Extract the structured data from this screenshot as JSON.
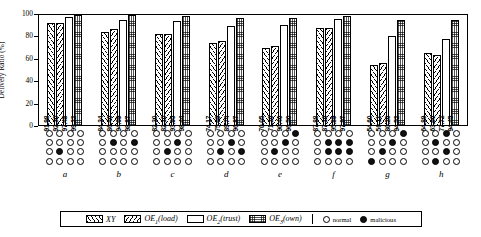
{
  "chart_data": {
    "type": "bar",
    "title": "",
    "xlabel": "",
    "ylabel": "Delivery Ratio (%)",
    "ylim": [
      0,
      100
    ],
    "yticks": [
      "0",
      "20",
      "40",
      "60",
      "80",
      "100"
    ],
    "grid": false,
    "legend_position": "bottom",
    "categories": [
      "a",
      "b",
      "c",
      "d",
      "e",
      "f",
      "g",
      "h"
    ],
    "series": [
      {
        "name": "XY",
        "pattern": "diagonal-hatch",
        "values": [
          91.98,
          84.34,
          82.3,
          74.17,
          70.05,
          87.88,
          54.6,
          64.89
        ],
        "labels": [
          "91.98",
          "84.34",
          "82.30",
          "74.17",
          "70.05",
          "87.88",
          "54.60",
          "64.89"
        ]
      },
      {
        "name": "OE1(load)",
        "pattern": "angled-hatch",
        "values": [
          92.3,
          86.46,
          82.1,
          75.69,
          71.26,
          87.16,
          56.11,
          63.66
        ],
        "labels": [
          "92.30",
          "86.46",
          "82.10",
          "75.69",
          "71.26",
          "87.16",
          "56.11",
          "63.66"
        ]
      },
      {
        "name": "OE2(trust)",
        "pattern": "plain-white",
        "values": [
          97.48,
          94.69,
          93.95,
          89.74,
          90.46,
          95.89,
          80.26,
          77.72
        ],
        "labels": [
          "97.48",
          "94.69",
          "93.95",
          "89.74",
          "90.46",
          "95.89",
          "80.26",
          "77.72"
        ]
      },
      {
        "name": "OE3(own)",
        "pattern": "grid-mesh",
        "values": [
          99.22,
          98.87,
          98.44,
          96.87,
          96.5,
          97.97,
          94.52,
          94.45
        ],
        "labels": [
          "99.22",
          "98.87",
          "98.44",
          "96.87",
          "96.50",
          "97.97",
          "94.52",
          "94.45"
        ]
      }
    ],
    "node_matrix": {
      "rows": 4,
      "cols": 4,
      "legend": {
        "normal": "normal",
        "malicious": "malicious"
      },
      "groups": [
        {
          "label": "a",
          "cells": [
            [
              0,
              0,
              0,
              0
            ],
            [
              0,
              0,
              0,
              0
            ],
            [
              0,
              1,
              0,
              0
            ],
            [
              0,
              0,
              0,
              0
            ]
          ]
        },
        {
          "label": "b",
          "cells": [
            [
              0,
              0,
              0,
              0
            ],
            [
              0,
              1,
              0,
              1
            ],
            [
              0,
              0,
              0,
              0
            ],
            [
              0,
              0,
              0,
              0
            ]
          ]
        },
        {
          "label": "c",
          "cells": [
            [
              0,
              0,
              0,
              0
            ],
            [
              0,
              0,
              1,
              0
            ],
            [
              0,
              1,
              0,
              0
            ],
            [
              0,
              0,
              0,
              0
            ]
          ]
        },
        {
          "label": "d",
          "cells": [
            [
              0,
              0,
              0,
              0
            ],
            [
              0,
              0,
              1,
              0
            ],
            [
              0,
              1,
              0,
              1
            ],
            [
              0,
              0,
              0,
              0
            ]
          ]
        },
        {
          "label": "e",
          "cells": [
            [
              0,
              0,
              0,
              1
            ],
            [
              0,
              0,
              1,
              0
            ],
            [
              0,
              1,
              0,
              0
            ],
            [
              0,
              0,
              0,
              0
            ]
          ]
        },
        {
          "label": "f",
          "cells": [
            [
              0,
              0,
              0,
              0
            ],
            [
              0,
              1,
              1,
              1
            ],
            [
              0,
              1,
              1,
              1
            ],
            [
              0,
              0,
              0,
              0
            ]
          ]
        },
        {
          "label": "g",
          "cells": [
            [
              0,
              0,
              0,
              1
            ],
            [
              0,
              0,
              1,
              0
            ],
            [
              0,
              1,
              0,
              0
            ],
            [
              1,
              0,
              0,
              0
            ]
          ]
        },
        {
          "label": "h",
          "cells": [
            [
              0,
              0,
              1,
              0
            ],
            [
              0,
              1,
              0,
              0
            ],
            [
              0,
              0,
              1,
              0
            ],
            [
              0,
              1,
              0,
              0
            ]
          ]
        }
      ]
    }
  },
  "legend": {
    "entries": [
      {
        "label": "XY",
        "sub": "",
        "tail": "",
        "pattern": "diagonal-hatch"
      },
      {
        "label": "OE",
        "sub": "1",
        "tail": "(load)",
        "pattern": "angled-hatch"
      },
      {
        "label": "OE",
        "sub": "2",
        "tail": "(trust)",
        "pattern": "plain-white"
      },
      {
        "label": "OE",
        "sub": "3",
        "tail": "(own)",
        "pattern": "grid-mesh"
      }
    ],
    "normal_label": "normal",
    "malicious_label": "malicious"
  }
}
